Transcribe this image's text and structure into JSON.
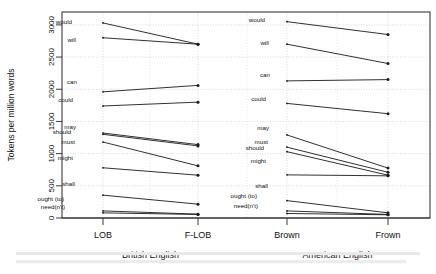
{
  "figure": {
    "axis": {
      "ylabel": "Tokens per million words",
      "yticks": [
        0,
        500,
        1000,
        1500,
        2000,
        2500,
        3000
      ],
      "ylim": [
        0,
        3200
      ]
    },
    "groups": [
      {
        "name": "British English",
        "corpora": [
          "LOB",
          "F-LOB"
        ]
      },
      {
        "name": "American English",
        "corpora": [
          "Brown",
          "Frown"
        ]
      }
    ]
  },
  "chart_data": {
    "type": "line",
    "title": "",
    "xlabel": "",
    "ylabel": "Tokens per million words",
    "ylim": [
      0,
      3200
    ],
    "yticks": [
      0,
      500,
      1000,
      1500,
      2000,
      2500,
      3000
    ],
    "grid": true,
    "legend": "inline-left-labels",
    "panels": [
      {
        "name": "British English",
        "categories": [
          "LOB",
          "F-LOB"
        ],
        "series": [
          {
            "name": "would",
            "values": [
              3030,
              2700
            ]
          },
          {
            "name": "will",
            "values": [
              2800,
              2700
            ]
          },
          {
            "name": "can",
            "values": [
              1960,
              2060
            ]
          },
          {
            "name": "could",
            "values": [
              1740,
              1800
            ]
          },
          {
            "name": "may",
            "values": [
              1320,
              1140
            ]
          },
          {
            "name": "should",
            "values": [
              1300,
              1120
            ]
          },
          {
            "name": "must",
            "values": [
              1180,
              810
            ]
          },
          {
            "name": "might",
            "values": [
              780,
              665
            ]
          },
          {
            "name": "shall",
            "values": [
              355,
              215
            ]
          },
          {
            "name": "ought (to)",
            "values": [
              110,
              60
            ]
          },
          {
            "name": "need(n't)",
            "values": [
              80,
              55
            ]
          }
        ]
      },
      {
        "name": "American English",
        "categories": [
          "Brown",
          "Frown"
        ],
        "series": [
          {
            "name": "would",
            "values": [
              3050,
              2850
            ]
          },
          {
            "name": "will",
            "values": [
              2700,
              2400
            ]
          },
          {
            "name": "can",
            "values": [
              2130,
              2150
            ]
          },
          {
            "name": "could",
            "values": [
              1780,
              1620
            ]
          },
          {
            "name": "may",
            "values": [
              1290,
              775
            ]
          },
          {
            "name": "must",
            "values": [
              1100,
              710
            ]
          },
          {
            "name": "should",
            "values": [
              1030,
              665
            ]
          },
          {
            "name": "might",
            "values": [
              670,
              655
            ]
          },
          {
            "name": "shall",
            "values": [
              270,
              80
            ]
          },
          {
            "name": "ought (to)",
            "values": [
              110,
              55
            ]
          },
          {
            "name": "need(n't)",
            "values": [
              70,
              50
            ]
          }
        ]
      }
    ]
  },
  "labels": {
    "left_panel": [
      {
        "text": "would",
        "x": 72,
        "y": 24
      },
      {
        "text": "will",
        "x": 76,
        "y": 42
      },
      {
        "text": "can",
        "x": 77,
        "y": 84
      },
      {
        "text": "could",
        "x": 73,
        "y": 102
      },
      {
        "text": "may",
        "x": 76,
        "y": 129
      },
      {
        "text": "should",
        "x": 71,
        "y": 134
      },
      {
        "text": "must",
        "x": 75,
        "y": 144
      },
      {
        "text": "might",
        "x": 73,
        "y": 160
      },
      {
        "text": "shall",
        "x": 75,
        "y": 186
      },
      {
        "text": "ought (to)",
        "x": 64,
        "y": 201
      },
      {
        "text": "need(n't)",
        "x": 65,
        "y": 209
      }
    ],
    "right_panel": [
      {
        "text": "would",
        "x": 265,
        "y": 22
      },
      {
        "text": "will",
        "x": 269,
        "y": 45
      },
      {
        "text": "can",
        "x": 270,
        "y": 77
      },
      {
        "text": "could",
        "x": 266,
        "y": 101
      },
      {
        "text": "may",
        "x": 269,
        "y": 130
      },
      {
        "text": "must",
        "x": 268,
        "y": 144
      },
      {
        "text": "should",
        "x": 264,
        "y": 150
      },
      {
        "text": "might",
        "x": 266,
        "y": 163
      },
      {
        "text": "shall",
        "x": 268,
        "y": 188
      },
      {
        "text": "ought (to)",
        "x": 257,
        "y": 198
      },
      {
        "text": "need(n't)",
        "x": 258,
        "y": 208
      }
    ]
  },
  "colors": {
    "line": "#1a1a1a",
    "grid": "#cfcfcf",
    "frame": "#3a3a3a",
    "text": "#111111"
  }
}
